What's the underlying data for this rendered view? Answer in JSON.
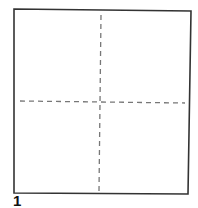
{
  "diagram": {
    "type": "fold-diagram",
    "step_label": "1",
    "square": {
      "corners": [
        [
          14,
          9
        ],
        [
          191,
          11
        ],
        [
          188,
          194
        ],
        [
          14,
          193
        ]
      ],
      "stroke": "#333333"
    },
    "fold_lines": [
      {
        "name": "vertical-center-fold",
        "style": "dashed",
        "from": [
          101,
          15
        ],
        "to": [
          99,
          191
        ]
      },
      {
        "name": "horizontal-center-fold",
        "style": "dashed",
        "from": [
          20,
          101
        ],
        "to": [
          185,
          103
        ]
      }
    ],
    "fold_line_color": "#777777"
  }
}
